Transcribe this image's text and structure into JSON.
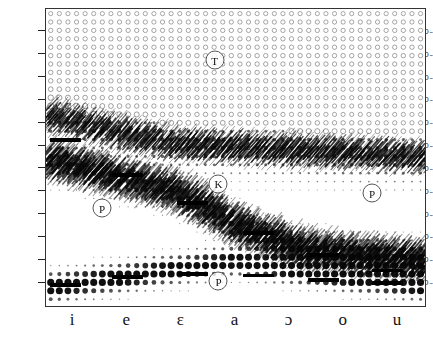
{
  "figure": {
    "title": "",
    "unit_suffix": "~"
  },
  "yaxis": {
    "label": "",
    "unit": "Hz",
    "ticks": [
      {
        "value": 4320,
        "label": "4320"
      },
      {
        "value": 3960,
        "label": "3960"
      },
      {
        "value": 3600,
        "label": "3600"
      },
      {
        "value": 3240,
        "label": "3240"
      },
      {
        "value": 2880,
        "label": "2880"
      },
      {
        "value": 2520,
        "label": "2520"
      },
      {
        "value": 2160,
        "label": "2160"
      },
      {
        "value": 1800,
        "label": "1800"
      },
      {
        "value": 1440,
        "label": "1440"
      },
      {
        "value": 1080,
        "label": "1080"
      },
      {
        "value": 720,
        "label": "720"
      },
      {
        "value": 360,
        "label": "360"
      }
    ],
    "min": 0,
    "max": 4680
  },
  "xaxis": {
    "label": "",
    "ticks": [
      {
        "label": "i"
      },
      {
        "label": "e"
      },
      {
        "label": "ɛ"
      },
      {
        "label": "a"
      },
      {
        "label": "ɔ"
      },
      {
        "label": "o"
      },
      {
        "label": "u"
      }
    ]
  },
  "markers": [
    {
      "label": "T",
      "x_frac": 0.445,
      "y_hz": 3870
    },
    {
      "label": "K",
      "x_frac": 0.455,
      "y_hz": 1930
    },
    {
      "label": "P",
      "x_frac": 0.148,
      "y_hz": 1540
    },
    {
      "label": "P",
      "x_frac": 0.86,
      "y_hz": 1780
    },
    {
      "label": "P",
      "x_frac": 0.455,
      "y_hz": 390
    }
  ],
  "formant_bars": [
    {
      "x_frac": 0.01,
      "width_frac": 0.082,
      "y_hz": 2620
    },
    {
      "x_frac": 0.175,
      "width_frac": 0.082,
      "y_hz": 2060
    },
    {
      "x_frac": 0.345,
      "width_frac": 0.082,
      "y_hz": 1620
    },
    {
      "x_frac": 0.52,
      "width_frac": 0.082,
      "y_hz": 1150
    },
    {
      "x_frac": 0.69,
      "width_frac": 0.082,
      "y_hz": 800
    },
    {
      "x_frac": 0.86,
      "width_frac": 0.082,
      "y_hz": 560
    },
    {
      "x_frac": 0.01,
      "width_frac": 0.082,
      "y_hz": 330
    },
    {
      "x_frac": 0.175,
      "width_frac": 0.082,
      "y_hz": 460
    },
    {
      "x_frac": 0.345,
      "width_frac": 0.082,
      "y_hz": 500
    },
    {
      "x_frac": 0.52,
      "width_frac": 0.082,
      "y_hz": 480
    },
    {
      "x_frac": 0.69,
      "width_frac": 0.082,
      "y_hz": 410
    },
    {
      "x_frac": 0.86,
      "width_frac": 0.082,
      "y_hz": 360
    }
  ],
  "chart_data": {
    "type": "heatmap",
    "title": "",
    "xlabel": "",
    "ylabel": "",
    "xlim": [
      0,
      1
    ],
    "ylim": [
      0,
      4680
    ],
    "grid": false,
    "legend": "none",
    "categories": [
      "i",
      "e",
      "ɛ",
      "a",
      "ɔ",
      "o",
      "u"
    ],
    "series": [
      {
        "name": "F1",
        "values": [
          300,
          430,
          580,
          720,
          570,
          440,
          330
        ]
      },
      {
        "name": "F2",
        "values": [
          2300,
          2050,
          1800,
          1250,
          900,
          800,
          720
        ]
      },
      {
        "name": "F3",
        "values": [
          3000,
          2750,
          2550,
          2500,
          2450,
          2400,
          2350
        ]
      }
    ]
  }
}
